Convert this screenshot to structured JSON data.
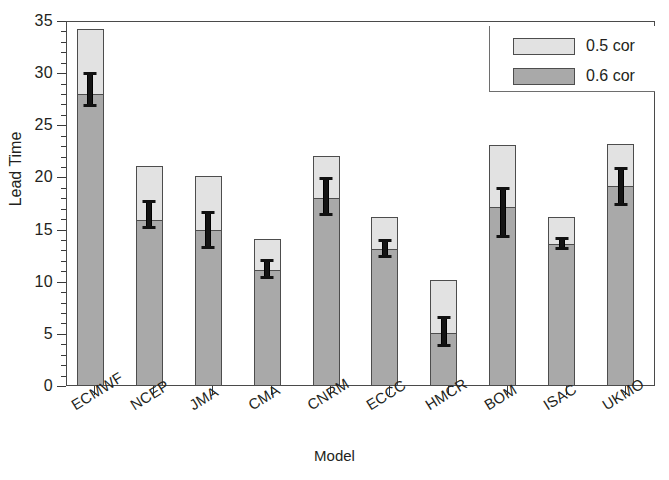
{
  "chart_data": {
    "type": "bar",
    "stacked": true,
    "title": "",
    "xlabel": "Model",
    "ylabel": "Lead Time",
    "ylim": [
      0,
      35
    ],
    "ytick_major_step": 5,
    "ytick_minor_step": 1,
    "ytick_labels": [
      "0",
      "5",
      "10",
      "15",
      "20",
      "25",
      "30",
      "35"
    ],
    "grid": false,
    "legend_position": "top-right",
    "categories": [
      "ECMWF",
      "NCEP",
      "JMA",
      "CMA",
      "CNRM",
      "ECCC",
      "HMCR",
      "BOM",
      "ISAC",
      "UKMO"
    ],
    "series": [
      {
        "name": "0.6 cor",
        "color": "#a9a9a9",
        "values": [
          28.0,
          15.9,
          15.0,
          11.1,
          18.0,
          13.1,
          5.1,
          17.2,
          13.6,
          19.2
        ]
      },
      {
        "name": "0.5 cor",
        "color": "#e2e2e2",
        "values": [
          34.2,
          21.1,
          20.1,
          14.1,
          22.1,
          16.2,
          10.2,
          23.1,
          16.2,
          23.2
        ]
      }
    ],
    "error_bars": {
      "description": "black vertical error bars centered on the 0.6 cor value",
      "center": [
        28.0,
        15.9,
        15.0,
        11.1,
        18.0,
        13.1,
        5.1,
        17.2,
        13.6,
        19.2
      ],
      "upper": [
        30.1,
        17.8,
        16.8,
        12.2,
        20.0,
        14.1,
        6.7,
        19.1,
        14.3,
        21.0
      ],
      "lower": [
        26.8,
        15.1,
        13.1,
        10.3,
        16.3,
        12.3,
        3.7,
        14.2,
        13.0,
        17.3
      ]
    }
  },
  "legend": {
    "items": [
      {
        "label": "0.5 cor",
        "color": "#e2e2e2"
      },
      {
        "label": "0.6 cor",
        "color": "#a9a9a9"
      }
    ]
  },
  "axes": {
    "y_title": "Lead Time",
    "x_title": "Model"
  }
}
